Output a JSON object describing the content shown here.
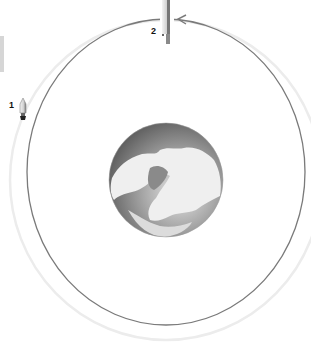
{
  "diagram": {
    "type": "orbit-diagram",
    "positions": [
      {
        "id": 1,
        "label": "1",
        "object": "rocket-launching-from-outer-orbit"
      },
      {
        "id": 2,
        "label": "2",
        "object": "rocket-at-top-of-orbit"
      }
    ],
    "center_object": "earth-globe-north-polar-view",
    "orbit_direction": "counter-clockwise-arrow-at-top",
    "colors": {
      "orbit_line": "#7a7a7a",
      "outer_ring": "#ececec",
      "earth_ocean": "#6a6a6a",
      "earth_land": "#f0f0f0",
      "label_text": "#111111",
      "side_tab": "#d6d6d6"
    }
  }
}
